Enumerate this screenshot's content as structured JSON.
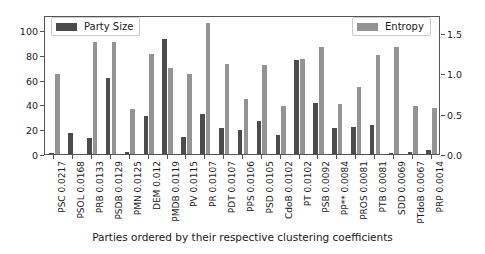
{
  "chart_data": {
    "type": "bar",
    "title": "",
    "subtitle": "",
    "xlabel": "Parties ordered by their respective clustering coefficients",
    "ylabel_left": "",
    "ylabel_right": "",
    "grid": false,
    "legend_position": "top-left and top-right",
    "categories": [
      "PSC 0.0217",
      "PSOL 0.0168",
      "PRB 0.0133",
      "PSDB 0.0129",
      "PMN 0.0125",
      "DEM 0.012",
      "PMDB 0.0119",
      "PV 0.0115",
      "PR 0.0107",
      "PDT 0.0107",
      "PPS 0.0106",
      "PSD 0.0105",
      "CdoB 0.0102",
      "PT 0.0102",
      "PSB 0.0092",
      "PP** 0.0084",
      "PROS 0.0081",
      "PTB 0.0081",
      "SDD 0.0069",
      "PTdoB 0.0067",
      "PRP 0.0014"
    ],
    "series": [
      {
        "name": "Party Size",
        "axis": "left",
        "color": "#4c4c4c",
        "ylim": [
          0,
          112
        ],
        "ticks": [
          0,
          20,
          40,
          60,
          80,
          100
        ],
        "values": [
          1,
          17,
          13,
          61,
          2,
          31,
          93,
          14,
          32,
          21,
          19,
          27,
          15,
          76,
          41,
          21,
          22,
          23,
          1,
          2,
          3
        ]
      },
      {
        "name": "Entropy",
        "axis": "right",
        "color": "#949494",
        "ylim": [
          0,
          1.72
        ],
        "ticks": [
          0.0,
          0.5,
          1.0,
          1.5
        ],
        "values": [
          0.99,
          0.0,
          1.39,
          1.39,
          0.56,
          1.24,
          1.07,
          0.99,
          1.62,
          1.12,
          0.68,
          1.1,
          0.6,
          1.18,
          1.33,
          0.62,
          0.83,
          1.22,
          1.32,
          0.6,
          0.57
        ]
      }
    ]
  },
  "legend": {
    "left_label": "Party Size",
    "right_label": "Entropy"
  },
  "axes": {
    "left_ticks": [
      "0",
      "20",
      "40",
      "60",
      "80",
      "100"
    ],
    "right_ticks": [
      "0.0",
      "0.5",
      "1.0",
      "1.5"
    ]
  }
}
